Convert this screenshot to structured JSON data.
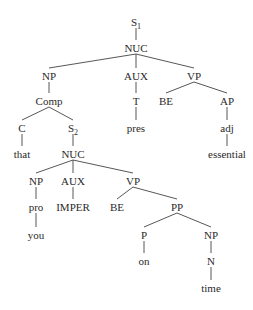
{
  "diagram": {
    "type": "syntax-tree",
    "colors": {
      "background": "#ffffff",
      "text": "#2a2a2a",
      "edge": "#444444"
    },
    "nodes": [
      {
        "id": "s1",
        "label": "S",
        "sub": "1",
        "x": 136,
        "y": 22
      },
      {
        "id": "nuc1",
        "label": "NUC",
        "x": 136,
        "y": 48
      },
      {
        "id": "np1",
        "label": "NP",
        "x": 49,
        "y": 76
      },
      {
        "id": "aux1",
        "label": "AUX",
        "x": 136,
        "y": 76
      },
      {
        "id": "vp1",
        "label": "VP",
        "x": 194,
        "y": 76
      },
      {
        "id": "comp",
        "label": "Comp",
        "x": 49,
        "y": 101
      },
      {
        "id": "t",
        "label": "T",
        "x": 136,
        "y": 101
      },
      {
        "id": "be1",
        "label": "BE",
        "x": 166,
        "y": 101
      },
      {
        "id": "ap",
        "label": "AP",
        "x": 227,
        "y": 101
      },
      {
        "id": "c",
        "label": "C",
        "x": 22,
        "y": 128
      },
      {
        "id": "s2",
        "label": "S",
        "sub": "2",
        "x": 73,
        "y": 128
      },
      {
        "id": "pres",
        "label": "pres",
        "x": 136,
        "y": 128
      },
      {
        "id": "adj",
        "label": "adj",
        "x": 227,
        "y": 128
      },
      {
        "id": "that",
        "label": "that",
        "x": 22,
        "y": 154
      },
      {
        "id": "nuc2",
        "label": "NUC",
        "x": 73,
        "y": 154
      },
      {
        "id": "essential",
        "label": "essential",
        "x": 227,
        "y": 154
      },
      {
        "id": "np2",
        "label": "NP",
        "x": 36,
        "y": 181
      },
      {
        "id": "aux2",
        "label": "AUX",
        "x": 73,
        "y": 181
      },
      {
        "id": "vp2",
        "label": "VP",
        "x": 133,
        "y": 181
      },
      {
        "id": "pro",
        "label": "pro",
        "x": 36,
        "y": 207
      },
      {
        "id": "imper",
        "label": "IMPER",
        "x": 73,
        "y": 207
      },
      {
        "id": "be2",
        "label": "BE",
        "x": 117,
        "y": 207
      },
      {
        "id": "pp",
        "label": "PP",
        "x": 177,
        "y": 207
      },
      {
        "id": "you",
        "label": "you",
        "x": 36,
        "y": 235
      },
      {
        "id": "p",
        "label": "P",
        "x": 144,
        "y": 235
      },
      {
        "id": "np3",
        "label": "NP",
        "x": 211,
        "y": 235
      },
      {
        "id": "on",
        "label": "on",
        "x": 144,
        "y": 261
      },
      {
        "id": "n",
        "label": "N",
        "x": 211,
        "y": 261
      },
      {
        "id": "time",
        "label": "time",
        "x": 211,
        "y": 288
      }
    ],
    "edges": [
      [
        "s1",
        "nuc1"
      ],
      [
        "nuc1",
        "np1"
      ],
      [
        "nuc1",
        "aux1"
      ],
      [
        "nuc1",
        "vp1"
      ],
      [
        "np1",
        "comp"
      ],
      [
        "aux1",
        "t"
      ],
      [
        "vp1",
        "be1"
      ],
      [
        "vp1",
        "ap"
      ],
      [
        "comp",
        "c"
      ],
      [
        "comp",
        "s2"
      ],
      [
        "t",
        "pres"
      ],
      [
        "ap",
        "adj"
      ],
      [
        "c",
        "that"
      ],
      [
        "s2",
        "nuc2"
      ],
      [
        "adj",
        "essential"
      ],
      [
        "nuc2",
        "np2"
      ],
      [
        "nuc2",
        "aux2"
      ],
      [
        "nuc2",
        "vp2"
      ],
      [
        "np2",
        "pro"
      ],
      [
        "aux2",
        "imper"
      ],
      [
        "vp2",
        "be2"
      ],
      [
        "vp2",
        "pp"
      ],
      [
        "pro",
        "you"
      ],
      [
        "pp",
        "p"
      ],
      [
        "pp",
        "np3"
      ],
      [
        "p",
        "on"
      ],
      [
        "np3",
        "n"
      ],
      [
        "n",
        "time"
      ]
    ]
  }
}
